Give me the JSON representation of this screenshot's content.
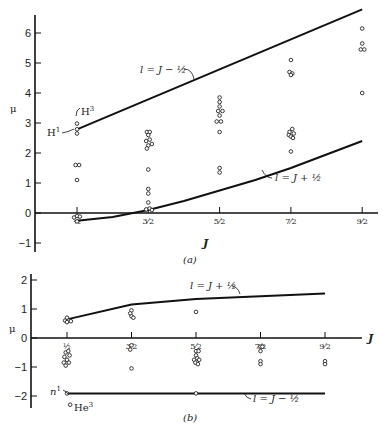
{
  "chart_data": [
    {
      "id": "a",
      "type": "scatter",
      "caption": "(a)",
      "xlabel": "J",
      "ylabel": "μ",
      "x_categories": [
        "½",
        "3⁄2",
        "5⁄2",
        "7⁄2",
        "9⁄2"
      ],
      "x_values": [
        0.5,
        1.5,
        2.5,
        3.5,
        4.5
      ],
      "yticks": [
        -1,
        0,
        1,
        2,
        3,
        4,
        5,
        6
      ],
      "ylim": [
        -1.2,
        6.6
      ],
      "grid": false,
      "lines": [
        {
          "name": "l = J − ½",
          "label": "l = J − ½",
          "x": [
            0.5,
            4.5
          ],
          "y": [
            2.79,
            6.79
          ]
        },
        {
          "name": "l = J + ½",
          "label": "l = J + ½",
          "x": [
            0.5,
            1.0,
            1.5,
            2.0,
            2.5,
            3.0,
            3.5,
            4.0,
            4.5
          ],
          "y": [
            -0.26,
            -0.13,
            0.1,
            0.4,
            0.75,
            1.1,
            1.5,
            1.95,
            2.4
          ]
        }
      ],
      "points": [
        {
          "x": 0.5,
          "y": 2.98,
          "label": "H³"
        },
        {
          "x": 0.5,
          "y": 2.79,
          "label": "H¹"
        },
        {
          "x": 0.5,
          "y": 2.65
        },
        {
          "x": 0.48,
          "y": 1.6
        },
        {
          "x": 0.53,
          "y": 1.6
        },
        {
          "x": 0.5,
          "y": 1.1
        },
        {
          "x": 0.46,
          "y": -0.15
        },
        {
          "x": 0.5,
          "y": -0.1
        },
        {
          "x": 0.54,
          "y": -0.12
        },
        {
          "x": 0.5,
          "y": -0.28
        },
        {
          "x": 1.48,
          "y": 2.7
        },
        {
          "x": 1.52,
          "y": 2.7
        },
        {
          "x": 1.5,
          "y": 2.6
        },
        {
          "x": 1.47,
          "y": 2.4
        },
        {
          "x": 1.52,
          "y": 2.45
        },
        {
          "x": 1.55,
          "y": 2.3
        },
        {
          "x": 1.5,
          "y": 2.25
        },
        {
          "x": 1.48,
          "y": 2.15
        },
        {
          "x": 1.5,
          "y": 1.45
        },
        {
          "x": 1.5,
          "y": 0.8
        },
        {
          "x": 1.5,
          "y": 0.65
        },
        {
          "x": 1.5,
          "y": 0.35
        },
        {
          "x": 1.47,
          "y": 0.12
        },
        {
          "x": 1.52,
          "y": 0.15
        },
        {
          "x": 1.55,
          "y": 0.1
        },
        {
          "x": 2.5,
          "y": 3.85
        },
        {
          "x": 2.5,
          "y": 3.7
        },
        {
          "x": 2.5,
          "y": 3.55
        },
        {
          "x": 2.48,
          "y": 3.4
        },
        {
          "x": 2.54,
          "y": 3.4
        },
        {
          "x": 2.5,
          "y": 3.25
        },
        {
          "x": 2.46,
          "y": 3.05
        },
        {
          "x": 2.52,
          "y": 3.05
        },
        {
          "x": 2.5,
          "y": 2.7
        },
        {
          "x": 2.5,
          "y": 1.5
        },
        {
          "x": 2.5,
          "y": 1.35
        },
        {
          "x": 3.5,
          "y": 5.1
        },
        {
          "x": 3.48,
          "y": 4.7
        },
        {
          "x": 3.52,
          "y": 4.65
        },
        {
          "x": 3.5,
          "y": 4.6
        },
        {
          "x": 3.52,
          "y": 2.8
        },
        {
          "x": 3.48,
          "y": 2.7
        },
        {
          "x": 3.54,
          "y": 2.65
        },
        {
          "x": 3.47,
          "y": 2.6
        },
        {
          "x": 3.5,
          "y": 2.55
        },
        {
          "x": 3.53,
          "y": 2.5
        },
        {
          "x": 3.5,
          "y": 2.05
        },
        {
          "x": 4.5,
          "y": 6.15
        },
        {
          "x": 4.5,
          "y": 5.65
        },
        {
          "x": 4.48,
          "y": 5.45
        },
        {
          "x": 4.53,
          "y": 5.45
        },
        {
          "x": 4.5,
          "y": 4.0
        }
      ],
      "annotations": [
        {
          "text": "l = J − ½",
          "target": "upper-line"
        },
        {
          "text": "l = J + ½",
          "target": "lower-line"
        },
        {
          "text": "H³",
          "target": "point"
        },
        {
          "text": "H¹",
          "target": "point"
        }
      ]
    },
    {
      "id": "b",
      "type": "scatter",
      "caption": "(b)",
      "xlabel": "J",
      "ylabel": "μ",
      "x_categories": [
        "½",
        "3⁄2",
        "5⁄2",
        "7⁄2",
        "9⁄2"
      ],
      "x_values": [
        0.5,
        1.5,
        2.5,
        3.5,
        4.5
      ],
      "yticks": [
        -2,
        -1,
        0,
        1,
        2
      ],
      "ylim": [
        -2.5,
        2.1
      ],
      "grid": false,
      "lines": [
        {
          "name": "l = J + ½",
          "label": "l = J + ½",
          "x": [
            0.5,
            1.5,
            2.5,
            3.5,
            4.5
          ],
          "y": [
            0.64,
            1.15,
            1.34,
            1.44,
            1.53
          ]
        },
        {
          "name": "l = J − ½",
          "label": "l = J − ½",
          "x": [
            0.5,
            4.5
          ],
          "y": [
            -1.91,
            -1.91
          ]
        }
      ],
      "points": [
        {
          "x": 0.47,
          "y": 0.6
        },
        {
          "x": 0.5,
          "y": 0.7
        },
        {
          "x": 0.53,
          "y": 0.6
        },
        {
          "x": 0.56,
          "y": 0.58
        },
        {
          "x": 0.5,
          "y": 0.55
        },
        {
          "x": 0.48,
          "y": -0.5
        },
        {
          "x": 0.52,
          "y": -0.45
        },
        {
          "x": 0.46,
          "y": -0.65
        },
        {
          "x": 0.54,
          "y": -0.6
        },
        {
          "x": 0.5,
          "y": -0.75
        },
        {
          "x": 0.45,
          "y": -0.85
        },
        {
          "x": 0.53,
          "y": -0.85
        },
        {
          "x": 0.48,
          "y": -0.95
        },
        {
          "x": 1.5,
          "y": 0.95
        },
        {
          "x": 1.48,
          "y": 0.85
        },
        {
          "x": 1.5,
          "y": 0.75
        },
        {
          "x": 1.53,
          "y": 0.7
        },
        {
          "x": 1.5,
          "y": -0.25
        },
        {
          "x": 1.48,
          "y": -0.4
        },
        {
          "x": 1.5,
          "y": -1.05
        },
        {
          "x": 2.5,
          "y": 0.9
        },
        {
          "x": 2.5,
          "y": -0.45
        },
        {
          "x": 2.54,
          "y": -0.45
        },
        {
          "x": 2.5,
          "y": -0.6
        },
        {
          "x": 2.47,
          "y": -0.75
        },
        {
          "x": 2.52,
          "y": -0.7
        },
        {
          "x": 2.55,
          "y": -0.75
        },
        {
          "x": 2.49,
          "y": -0.85
        },
        {
          "x": 2.53,
          "y": -0.9
        },
        {
          "x": 3.5,
          "y": -0.3
        },
        {
          "x": 3.53,
          "y": -0.3
        },
        {
          "x": 3.5,
          "y": -0.45
        },
        {
          "x": 3.5,
          "y": -0.8
        },
        {
          "x": 3.5,
          "y": -0.9
        },
        {
          "x": 4.5,
          "y": -0.8
        },
        {
          "x": 4.5,
          "y": -0.9
        },
        {
          "x": 0.5,
          "y": -1.91,
          "label": "n¹"
        },
        {
          "x": 2.5,
          "y": -1.91
        },
        {
          "x": 0.55,
          "y": -2.3,
          "label": "He³"
        }
      ],
      "annotations": [
        {
          "text": "l = J + ½",
          "target": "upper-line"
        },
        {
          "text": "l = J − ½",
          "target": "lower-line"
        },
        {
          "text": "n¹",
          "target": "point"
        },
        {
          "text": "He³",
          "target": "point"
        }
      ]
    }
  ],
  "labels": {
    "a": {
      "caption": "(a)",
      "ylabel": "μ",
      "xlabel": "J",
      "yticks": [
        "6",
        "5",
        "4",
        "3",
        "2",
        "1",
        "0",
        "−1"
      ],
      "xticks": [
        "½",
        "3⁄2",
        "5⁄2",
        "7⁄2",
        "9⁄2"
      ],
      "upper_line": "l = J − ½",
      "lower_line": "l = J + ½",
      "h3": "H",
      "h3_sup": "3",
      "h1": "H",
      "h1_sup": "1"
    },
    "b": {
      "caption": "(b)",
      "ylabel": "μ",
      "xlabel": "J",
      "yticks": [
        "2",
        "1",
        "0",
        "−1",
        "−2"
      ],
      "xticks": [
        "½",
        "3⁄2",
        "5⁄2",
        "7⁄2",
        "9⁄2"
      ],
      "upper_line": "l = J + ½",
      "lower_line": "l = J − ½",
      "n1": "n",
      "n1_sup": "1",
      "he3": "He",
      "he3_sup": "3"
    }
  }
}
